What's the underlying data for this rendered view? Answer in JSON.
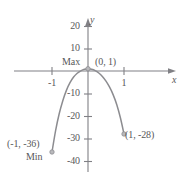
{
  "figure": {
    "axis_labels": {
      "x": "x",
      "y": "y"
    },
    "y_ticks": [
      "20",
      "10",
      "-10",
      "-20",
      "-30",
      "-40"
    ],
    "x_ticks": [
      "-1",
      "1"
    ],
    "annotations": {
      "max_label": "Max",
      "max_point": "(0, 1)",
      "min_label": "Min",
      "min_point": "(-1, -36)",
      "right_point": "(1, -28)"
    },
    "colors": {
      "curve": "#8c8c90",
      "axis": "#808085",
      "text": "#58585a",
      "background": "#ffffff"
    }
  },
  "chart_data": {
    "type": "line",
    "title": "",
    "xlabel": "x",
    "ylabel": "y",
    "xlim": [
      -1.35,
      1.75
    ],
    "ylim": [
      -42,
      24
    ],
    "xticks": [
      -1,
      1
    ],
    "yticks": [
      20,
      10,
      -10,
      -20,
      -30,
      -40
    ],
    "grid": false,
    "legend": null,
    "series": [
      {
        "name": "curve",
        "points": [
          [
            -1.0,
            -36
          ],
          [
            -0.9,
            -26.5
          ],
          [
            -0.8,
            -19.0
          ],
          [
            -0.7,
            -13.2
          ],
          [
            -0.6,
            -8.6
          ],
          [
            -0.5,
            -5.2
          ],
          [
            -0.4,
            -2.7
          ],
          [
            -0.3,
            -1.0
          ],
          [
            -0.2,
            0.1
          ],
          [
            -0.1,
            0.8
          ],
          [
            0.0,
            1.0
          ],
          [
            0.1,
            0.8
          ],
          [
            0.2,
            0.2
          ],
          [
            0.3,
            -0.9
          ],
          [
            0.4,
            -2.4
          ],
          [
            0.5,
            -4.5
          ],
          [
            0.6,
            -7.2
          ],
          [
            0.7,
            -10.6
          ],
          [
            0.8,
            -15.0
          ],
          [
            0.9,
            -20.8
          ],
          [
            1.0,
            -28.0
          ]
        ]
      }
    ],
    "annotated_points": [
      {
        "label": "Max",
        "coords": "(0, 1)",
        "x": 0,
        "y": 1
      },
      {
        "label": "Min",
        "coords": "(-1, -36)",
        "x": -1,
        "y": -36
      },
      {
        "label": "",
        "coords": "(1, -28)",
        "x": 1,
        "y": -28
      }
    ]
  }
}
